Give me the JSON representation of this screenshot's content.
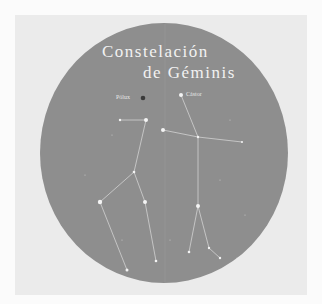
{
  "title": {
    "line1": "Constelación",
    "line2": "de Géminis"
  },
  "labels": {
    "pollux": "Pólux",
    "castor": "Cástor"
  },
  "colors": {
    "page": "#fbfbfb",
    "panel": "#ebebeb",
    "sky": "#8e8e8e",
    "star": "#f4f4f4",
    "line": "#cfcfcf",
    "pollux_dot": "#3a3a3a"
  }
}
